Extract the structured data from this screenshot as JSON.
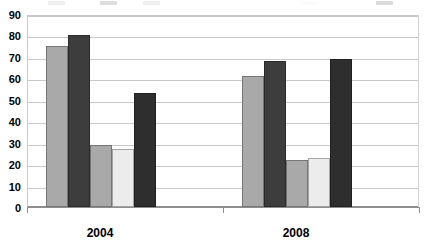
{
  "chart_data": {
    "type": "bar",
    "title": "",
    "xlabel": "",
    "ylabel": "",
    "categories": [
      "2004",
      "2008"
    ],
    "ylim": [
      0,
      90
    ],
    "ytick_step": 10,
    "yticks": [
      0,
      10,
      20,
      30,
      40,
      50,
      60,
      70,
      80,
      90
    ],
    "grid": true,
    "legend_position": "top",
    "legend_visible": false,
    "legend_note": "legend row is cropped off the top edge of the screenshot; only faint partial swatches remain",
    "series": [
      {
        "name": "Series 1",
        "color": "#a9a9a9",
        "values": [
          75,
          61
        ]
      },
      {
        "name": "Series 2",
        "color": "#3d3d3d",
        "values": [
          80,
          68
        ]
      },
      {
        "name": "Series 3",
        "color": "#a9a9a9",
        "values": [
          29,
          22
        ]
      },
      {
        "name": "Series 4",
        "color": "#ececec",
        "values": [
          27,
          23
        ]
      },
      {
        "name": "Series 5",
        "color": "#2e2e2e",
        "values": [
          53,
          69
        ]
      }
    ]
  },
  "legend_fragments": [
    {
      "color": "#a9a9a9",
      "label": "",
      "x": 48
    },
    {
      "color": "#3d3d3d",
      "label": "",
      "x": 100
    },
    {
      "color": "#a9a9a9",
      "label": "",
      "x": 143
    },
    {
      "color": "#ececec",
      "label": "",
      "x": 300
    },
    {
      "color": "#2e2e2e",
      "label": "",
      "x": 376
    }
  ]
}
